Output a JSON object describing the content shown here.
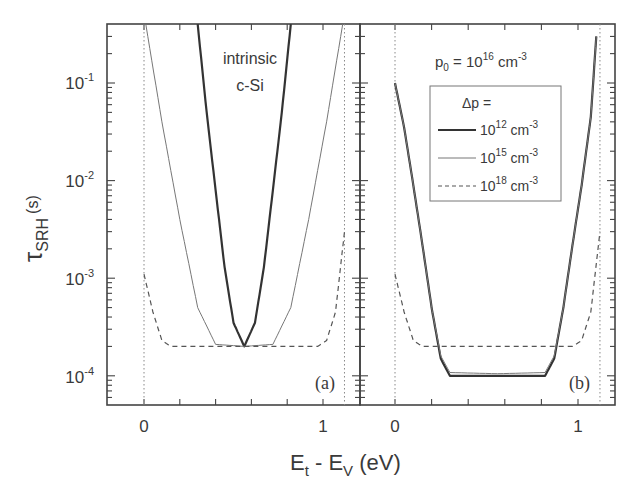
{
  "chart_data": {
    "type": "line",
    "ylabel": "τSRH (s)",
    "ylabel_main": "τ",
    "ylabel_sub": "SRH",
    "ylabel_unit": "(s)",
    "xlabel": "Et - EV (eV)",
    "xlabel_parts": {
      "e1": "E",
      "s1": "t",
      "mid": " - E",
      "s2": "V",
      "unit": " (eV)"
    },
    "yscale": "log",
    "ylim": [
      5e-05,
      0.4
    ],
    "xlim": [
      -0.2,
      1.2
    ],
    "y_ticks": [
      {
        "base": "10",
        "exp": "-1",
        "value": 0.1
      },
      {
        "base": "10",
        "exp": "-2",
        "value": 0.01
      },
      {
        "base": "10",
        "exp": "-3",
        "value": 0.001
      },
      {
        "base": "10",
        "exp": "-4",
        "value": 0.0001
      }
    ],
    "x_ticks": [
      {
        "label": "0",
        "value": 0
      },
      {
        "label": "1",
        "value": 1
      }
    ],
    "bandgap_markers_eV": [
      0,
      1.12
    ],
    "panels": [
      {
        "id": "a",
        "label": "(a)",
        "annotation": [
          "intrinsic",
          "c-Si"
        ],
        "series": [
          {
            "name": "Δp = 10^12 cm^-3",
            "style": "thick-solid",
            "x": [
              0.3,
              0.35,
              0.4,
              0.45,
              0.5,
              0.56,
              0.62,
              0.67,
              0.72,
              0.77,
              0.82
            ],
            "y": [
              0.4,
              0.05,
              0.008,
              0.0013,
              0.00035,
              0.0002,
              0.00035,
              0.0013,
              0.008,
              0.05,
              0.4
            ]
          },
          {
            "name": "Δp = 10^15 cm^-3",
            "style": "thin-solid",
            "x": [
              0.01,
              0.1,
              0.2,
              0.3,
              0.4,
              0.56,
              0.72,
              0.82,
              0.92,
              1.02,
              1.11
            ],
            "y": [
              0.4,
              0.04,
              0.004,
              0.0005,
              0.00021,
              0.0002,
              0.00021,
              0.0005,
              0.004,
              0.04,
              0.4
            ]
          },
          {
            "name": "Δp = 10^18 cm^-3",
            "style": "dashed",
            "x": [
              0.0,
              0.05,
              0.1,
              0.15,
              0.56,
              0.97,
              1.02,
              1.07,
              1.12
            ],
            "y": [
              0.0011,
              0.00045,
              0.00023,
              0.0002,
              0.0002,
              0.0002,
              0.00023,
              0.00045,
              0.003
            ]
          }
        ]
      },
      {
        "id": "b",
        "label": "(b)",
        "annotation": {
          "text": "p",
          "sub": "0",
          "eq": " = 10",
          "sup": "16",
          "unit": " cm",
          "unit_sup": "-3"
        },
        "series": [
          {
            "name": "Δp = 10^12 cm^-3",
            "style": "thick-solid",
            "x": [
              0.0,
              0.05,
              0.1,
              0.15,
              0.2,
              0.25,
              0.3,
              0.56,
              0.82,
              0.87,
              0.92,
              0.97,
              1.02,
              1.07,
              1.1
            ],
            "y": [
              0.1,
              0.035,
              0.009,
              0.0022,
              0.0005,
              0.00015,
              0.0001,
              0.0001,
              0.0001,
              0.00015,
              0.0005,
              0.0022,
              0.009,
              0.045,
              0.3
            ]
          },
          {
            "name": "Δp = 10^15 cm^-3",
            "style": "thin-solid",
            "x": [
              0.0,
              0.05,
              0.1,
              0.15,
              0.2,
              0.25,
              0.3,
              0.56,
              0.82,
              0.87,
              0.92,
              0.97,
              1.02,
              1.07,
              1.1
            ],
            "y": [
              0.1,
              0.035,
              0.009,
              0.0022,
              0.0005,
              0.00016,
              0.000108,
              0.000105,
              0.000108,
              0.00016,
              0.0005,
              0.0022,
              0.009,
              0.045,
              0.3
            ]
          },
          {
            "name": "Δp = 10^18 cm^-3",
            "style": "dashed",
            "x": [
              0.0,
              0.05,
              0.1,
              0.15,
              0.56,
              0.97,
              1.02,
              1.07,
              1.12
            ],
            "y": [
              0.0011,
              0.00045,
              0.00023,
              0.0002,
              0.0002,
              0.0002,
              0.00023,
              0.00045,
              0.003
            ]
          }
        ]
      }
    ],
    "legend": {
      "title": "Δp =",
      "position": "panel-b upper center",
      "entries": [
        {
          "base": "10",
          "exp": "12",
          "unit": " cm",
          "unit_exp": "-3",
          "style": "thick-solid"
        },
        {
          "base": "10",
          "exp": "15",
          "unit": " cm",
          "unit_exp": "-3",
          "style": "thin-solid"
        },
        {
          "base": "10",
          "exp": "18",
          "unit": " cm",
          "unit_exp": "-3",
          "style": "dashed"
        }
      ]
    },
    "grid": false
  }
}
